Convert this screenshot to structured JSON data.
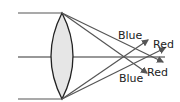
{
  "diagram": {
    "labels": {
      "blue_top": "Blue",
      "red_top": "Red",
      "red_bottom": "Red",
      "blue_bottom": "Blue"
    },
    "colors": {
      "ray": "#555555",
      "axis": "#333333",
      "lens_fill": "#e6e6e6",
      "lens_stroke": "#222222",
      "text": "#222222"
    }
  }
}
